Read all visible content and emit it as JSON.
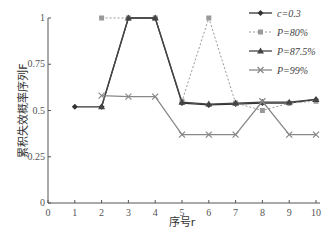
{
  "chart_data": {
    "type": "line",
    "title": "",
    "xlabel": "序号r",
    "ylabel": "累积失效概率序列F",
    "xlim": [
      0,
      10
    ],
    "ylim": [
      0,
      1
    ],
    "x_ticks": [
      "0",
      "1",
      "2",
      "3",
      "4",
      "5",
      "6",
      "7",
      "8",
      "9",
      "10"
    ],
    "y_ticks": [
      "0",
      "0.25",
      "0.5",
      "0.75",
      "1"
    ],
    "grid": false,
    "legend_position": "upper right",
    "series": [
      {
        "name": "c=0.3",
        "marker": "diamond",
        "line": "solid",
        "color": "#333333",
        "x": [
          1,
          2,
          3,
          4,
          5,
          6,
          7,
          8,
          9,
          10
        ],
        "values": [
          0.52,
          0.52,
          1.0,
          1.0,
          0.54,
          0.53,
          0.535,
          0.54,
          0.54,
          0.56
        ]
      },
      {
        "name": "P=80%",
        "marker": "square",
        "line": "dotted",
        "color": "#999999",
        "x": [
          2,
          3,
          4,
          5,
          6,
          7,
          8,
          9,
          10
        ],
        "values": [
          1.0,
          1.0,
          1.0,
          0.55,
          1.0,
          0.54,
          0.5,
          0.54,
          0.55
        ]
      },
      {
        "name": "P=87.5%",
        "marker": "triangle",
        "line": "solid",
        "color": "#444444",
        "x": [
          2,
          3,
          4,
          5,
          6,
          7,
          8,
          9,
          10
        ],
        "values": [
          0.52,
          1.0,
          1.0,
          0.545,
          0.535,
          0.54,
          0.545,
          0.545,
          0.56
        ]
      },
      {
        "name": "P=99%",
        "marker": "x",
        "line": "solid",
        "color": "#888888",
        "x": [
          2,
          3,
          4,
          5,
          6,
          7,
          8,
          9,
          10
        ],
        "values": [
          0.58,
          0.575,
          0.575,
          0.37,
          0.37,
          0.37,
          0.55,
          0.37,
          0.37
        ]
      }
    ]
  }
}
